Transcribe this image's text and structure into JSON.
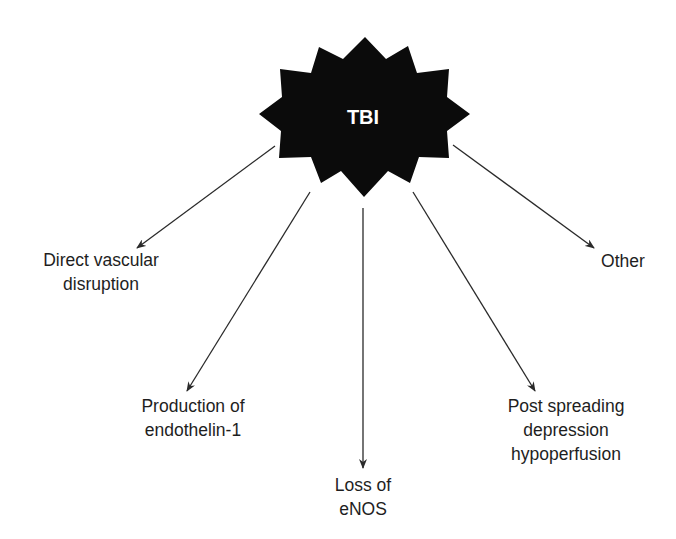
{
  "diagram": {
    "center": {
      "label": "TBI",
      "shape": "12-point starburst",
      "fill_color": "#0b0b0b",
      "text_color": "#ffffff"
    },
    "branches": [
      {
        "id": "direct-vascular-disruption",
        "lines": [
          "Direct vascular",
          "disruption"
        ]
      },
      {
        "id": "production-of-endothelin-1",
        "lines": [
          "Production of",
          "endothelin-1"
        ]
      },
      {
        "id": "loss-of-enos",
        "lines": [
          "Loss of",
          "eNOS"
        ]
      },
      {
        "id": "post-spreading-depression-hypoperfusion",
        "lines": [
          "Post spreading",
          "depression",
          "hypoperfusion"
        ]
      },
      {
        "id": "other",
        "lines": [
          "Other"
        ]
      }
    ],
    "colors": {
      "background": "#ffffff",
      "arrow": "#2a2a2a",
      "text": "#1e1e1e"
    }
  }
}
